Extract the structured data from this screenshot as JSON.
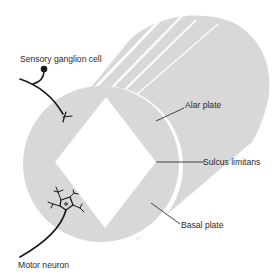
{
  "diagram": {
    "labels": {
      "sensory_ganglion_cell": "Sensory ganglion cell",
      "alar_plate": "Alar plate",
      "sulcus_limitans": "Sulcus limitans",
      "basal_plate": "Basal plate",
      "motor_neuron": "Motor neuron"
    },
    "colors": {
      "tissue_gray": "#d8d8d8",
      "line": "#1a1a1a",
      "background": "#ffffff"
    }
  }
}
